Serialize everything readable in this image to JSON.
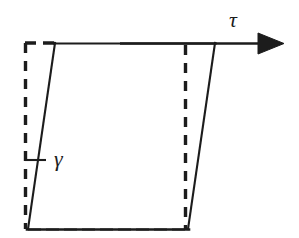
{
  "figure": {
    "name": "shear-deformation-diagram",
    "background_color": "#ffffff",
    "stroke_color": "#1c1c1c",
    "width": 299,
    "height": 238
  },
  "labels": {
    "shear_stress": "τ",
    "shear_strain": "γ"
  },
  "geometry": {
    "original_rectangle": {
      "style": "dashed",
      "points": [
        [
          25,
          43
        ],
        [
          185,
          43
        ],
        [
          185,
          228
        ],
        [
          25,
          228
        ]
      ]
    },
    "deformed_parallelogram": {
      "style": "solid",
      "points": [
        [
          55,
          43
        ],
        [
          215,
          43
        ],
        [
          188,
          228
        ],
        [
          28,
          228
        ]
      ]
    },
    "stress_arrow": {
      "shaft_start": [
        55,
        43
      ],
      "shaft_end": [
        262,
        43
      ],
      "tip": [
        284,
        43
      ],
      "head_half_height": 10
    },
    "strain_angle_tick": {
      "start": [
        25,
        160
      ],
      "end": [
        46,
        160
      ]
    }
  }
}
